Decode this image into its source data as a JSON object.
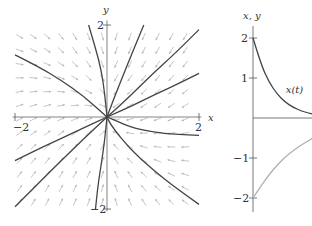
{
  "chart_data": [
    {
      "type": "line",
      "subtype": "phase-portrait",
      "title": "",
      "xlabel": "x",
      "ylabel": "y",
      "xlim": [
        -2.2,
        2.2
      ],
      "ylim": [
        -2.1,
        2.1
      ],
      "xticks": [
        {
          "value": -2,
          "label": "−2"
        },
        {
          "value": 2,
          "label": "2"
        }
      ],
      "yticks": [
        {
          "value": 2,
          "label": "2"
        },
        {
          "value": -2,
          "label": "−2"
        }
      ],
      "grid": false,
      "direction_field": true,
      "field_color": "#b8b8b8",
      "curve_color": "#444444",
      "system": "dx/dt = -x, dy/dt = -2x + y·0 ... (node-like field converging to origin)",
      "solution_curves": [
        {
          "name": "curve-1",
          "points": [
            [
              -2.0,
              1.35
            ],
            [
              -1.5,
              1.1
            ],
            [
              -1.0,
              0.8
            ],
            [
              -0.5,
              0.45
            ],
            [
              0,
              0
            ]
          ]
        },
        {
          "name": "curve-2",
          "points": [
            [
              -0.4,
              2.0
            ],
            [
              -0.25,
              1.5
            ],
            [
              -0.12,
              1.0
            ],
            [
              -0.05,
              0.5
            ],
            [
              0,
              0
            ]
          ]
        },
        {
          "name": "curve-3",
          "points": [
            [
              0.8,
              2.0
            ],
            [
              0.55,
              1.4
            ],
            [
              0.35,
              0.9
            ],
            [
              0.15,
              0.4
            ],
            [
              0,
              0
            ]
          ]
        },
        {
          "name": "curve-4",
          "points": [
            [
              2.0,
              1.9
            ],
            [
              1.5,
              1.4
            ],
            [
              1.0,
              0.95
            ],
            [
              0.5,
              0.45
            ],
            [
              0,
              0
            ]
          ]
        },
        {
          "name": "curve-5",
          "points": [
            [
              2.0,
              0.95
            ],
            [
              1.5,
              0.7
            ],
            [
              1.0,
              0.47
            ],
            [
              0.5,
              0.22
            ],
            [
              0,
              0
            ]
          ]
        },
        {
          "name": "curve-6",
          "points": [
            [
              2.0,
              -0.4
            ],
            [
              1.5,
              -0.38
            ],
            [
              1.0,
              -0.33
            ],
            [
              0.5,
              -0.22
            ],
            [
              0.2,
              -0.08
            ],
            [
              0,
              0
            ]
          ]
        },
        {
          "name": "curve-7",
          "points": [
            [
              2.0,
              -1.9
            ],
            [
              1.5,
              -1.55
            ],
            [
              1.0,
              -1.15
            ],
            [
              0.5,
              -0.7
            ],
            [
              0.1,
              -0.2
            ],
            [
              0,
              0
            ]
          ]
        },
        {
          "name": "curve-8",
          "points": [
            [
              -0.25,
              -2.0
            ],
            [
              -0.2,
              -1.5
            ],
            [
              -0.12,
              -1.0
            ],
            [
              -0.05,
              -0.5
            ],
            [
              0,
              0
            ]
          ]
        },
        {
          "name": "curve-9",
          "points": [
            [
              -2.0,
              -1.95
            ],
            [
              -1.5,
              -1.45
            ],
            [
              -1.0,
              -0.95
            ],
            [
              -0.5,
              -0.47
            ],
            [
              0,
              0
            ]
          ]
        },
        {
          "name": "curve-10",
          "points": [
            [
              -2.0,
              -0.95
            ],
            [
              -1.5,
              -0.7
            ],
            [
              -1.0,
              -0.47
            ],
            [
              -0.5,
              -0.23
            ],
            [
              0,
              0
            ]
          ]
        }
      ]
    },
    {
      "type": "line",
      "title": "",
      "xlabel": "",
      "ylabel": "x, y",
      "ylim": [
        -2.3,
        2.3
      ],
      "xlim": [
        0,
        1.5
      ],
      "yticks": [
        {
          "value": 2,
          "label": "2"
        },
        {
          "value": 1,
          "label": "1"
        },
        {
          "value": -1,
          "label": "−1"
        },
        {
          "value": -2,
          "label": "−2"
        }
      ],
      "grid": false,
      "series": [
        {
          "name": "x(t)",
          "label": "x(t)",
          "color": "#444444",
          "x": [
            0,
            0.2,
            0.4,
            0.6,
            0.8,
            1.0,
            1.2,
            1.4,
            1.5
          ],
          "values": [
            2.0,
            1.34,
            0.9,
            0.6,
            0.4,
            0.27,
            0.18,
            0.12,
            0.1
          ]
        },
        {
          "name": "y(t)",
          "label": "",
          "color": "#b0b0b0",
          "x": [
            0,
            0.2,
            0.4,
            0.6,
            0.8,
            1.0,
            1.2,
            1.4,
            1.5
          ],
          "values": [
            -2.0,
            -1.7,
            -1.42,
            -1.18,
            -0.98,
            -0.82,
            -0.68,
            -0.56,
            -0.5
          ]
        }
      ]
    }
  ]
}
